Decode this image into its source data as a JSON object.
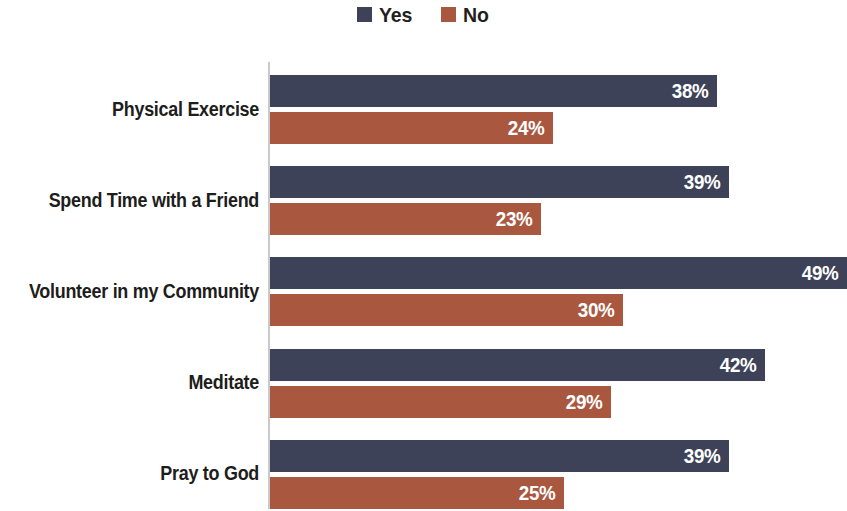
{
  "chart_data": {
    "type": "bar",
    "orientation": "horizontal",
    "grouping": "grouped",
    "title": "",
    "subtitle": "",
    "xlabel": "",
    "ylabel": "",
    "categories": [
      "Physical Exercise",
      "Spend Time with a Friend",
      "Volunteer in my Community",
      "Meditate",
      "Pray to God"
    ],
    "series": [
      {
        "name": "Yes",
        "color": "#3d4258",
        "values": [
          38,
          39,
          49,
          42,
          39
        ],
        "labels": [
          "38%",
          "39%",
          "49%",
          "42%",
          "39%"
        ]
      },
      {
        "name": "No",
        "color": "#a9583f",
        "values": [
          24,
          23,
          30,
          29,
          25
        ],
        "labels": [
          "24%",
          "23%",
          "30%",
          "29%",
          "25%"
        ]
      }
    ],
    "value_suffix": "%",
    "xlim": [
      0,
      49
    ],
    "grid": false,
    "axis_line": "vertical-left",
    "legend": {
      "position": "top-center",
      "entries": [
        {
          "label": "Yes",
          "color": "#3d4258",
          "icon": "square-swatch-icon"
        },
        {
          "label": "No",
          "color": "#a9583f",
          "icon": "square-swatch-icon"
        }
      ]
    }
  },
  "colors": {
    "yes": "#3d4258",
    "no": "#a9583f",
    "axis": "#c9c9c9",
    "text": "#1d1d1b",
    "value_text": "#ffffff",
    "background": "#ffffff"
  }
}
